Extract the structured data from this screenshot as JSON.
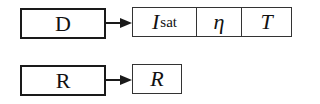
{
  "diagram": {
    "rows": [
      {
        "component": "D",
        "params": [
          {
            "symbol": "I",
            "subscript": "sat"
          },
          {
            "symbol": "η",
            "subscript": ""
          },
          {
            "symbol": "T",
            "subscript": ""
          }
        ]
      },
      {
        "component": "R",
        "params": [
          {
            "symbol": "R",
            "subscript": ""
          }
        ]
      }
    ]
  }
}
